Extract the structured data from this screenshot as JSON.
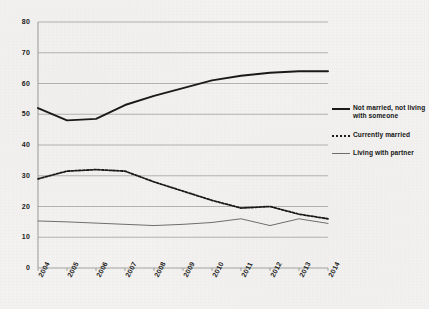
{
  "chart_data": {
    "type": "line",
    "title": "",
    "subtitle": "",
    "xlabel": "",
    "ylabel": "",
    "categories": [
      "2004",
      "2005",
      "2006",
      "2007",
      "2008",
      "2009",
      "2010",
      "2011",
      "2012",
      "2013",
      "2014"
    ],
    "x": [
      2004,
      2005,
      2006,
      2007,
      2008,
      2009,
      2010,
      2011,
      2012,
      2013,
      2014
    ],
    "ylim": [
      0,
      80
    ],
    "yticks": [
      0,
      10,
      20,
      30,
      40,
      50,
      60,
      70,
      80
    ],
    "ytick_labels": [
      "0",
      "10",
      "20",
      "30",
      "40",
      "50",
      "60",
      "70",
      "80"
    ],
    "grid": true,
    "legend_position": "right",
    "series": [
      {
        "name": "Not married, not living with someone",
        "style": "solid-thick",
        "color": "#1a1a1a",
        "values": [
          52,
          48,
          48.5,
          53,
          56,
          58.5,
          61,
          62.5,
          63.5,
          64,
          64
        ]
      },
      {
        "name": "Currently married",
        "style": "dashed",
        "color": "#1a1a1a",
        "values": [
          29,
          31.5,
          32,
          31.5,
          28,
          25,
          22,
          19.5,
          20,
          17.5,
          16
        ]
      },
      {
        "name": "Living with partner",
        "style": "solid-thin",
        "color": "#6f6f6f",
        "values": [
          15.3,
          15,
          14.6,
          14.2,
          13.8,
          14.2,
          14.8,
          16,
          13.8,
          16,
          14.5
        ]
      }
    ]
  },
  "legend": {
    "items": [
      {
        "label": "Not married, not living with someone",
        "swatch": "solid-thick"
      },
      {
        "label": "Currently married",
        "swatch": "dashed"
      },
      {
        "label": "Living with partner",
        "swatch": "solid-thin"
      }
    ]
  }
}
